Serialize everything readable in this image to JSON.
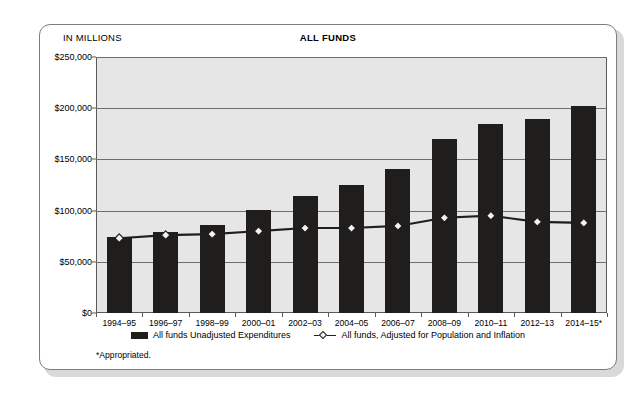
{
  "card": {
    "units_label": "IN MILLIONS",
    "footnote": "*Appropriated."
  },
  "chart_data": {
    "type": "bar",
    "title": "ALL FUNDS",
    "xlabel": "",
    "ylabel": "IN MILLIONS",
    "ylim": [
      0,
      250000
    ],
    "ytick_labels": [
      "$0",
      "$50,000",
      "$100,000",
      "$150,000",
      "$200,000",
      "$250,000"
    ],
    "ytick_values": [
      0,
      50000,
      100000,
      150000,
      200000,
      250000
    ],
    "grid": true,
    "legend_position": "bottom",
    "categories": [
      "1994–95",
      "1996–97",
      "1998–99",
      "2000–01",
      "2002–03",
      "2004–05",
      "2006–07",
      "2008–09",
      "2010–11",
      "2012–13",
      "2014–15*"
    ],
    "series": [
      {
        "name": "All funds Unadjusted Expenditures",
        "type": "bar",
        "color": "#201d1d",
        "values": [
          74500,
          79000,
          86000,
          101000,
          114000,
          125000,
          141000,
          170000,
          185000,
          189000,
          202000
        ]
      },
      {
        "name": "All funds, Adjusted for Population and Inflation",
        "type": "line",
        "marker": "diamond",
        "color": "#201d1d",
        "values": [
          73000,
          76000,
          77000,
          80000,
          83000,
          83000,
          85000,
          93000,
          95000,
          89000,
          88000
        ]
      }
    ],
    "annotations": [
      "*Appropriated."
    ]
  }
}
